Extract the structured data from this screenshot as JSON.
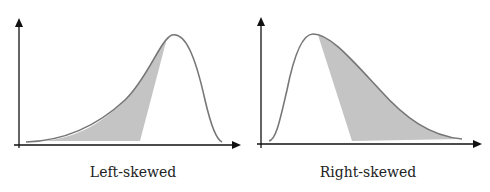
{
  "panels": [
    {
      "id": "left",
      "label": "Left-skewed",
      "shaded": "left tail to just before peak"
    },
    {
      "id": "right",
      "label": "Right-skewed",
      "shaded": "just after peak to right tail"
    }
  ],
  "colors": {
    "curve": "#777777",
    "fill": "#c4c4c4",
    "axis": "#111111"
  }
}
